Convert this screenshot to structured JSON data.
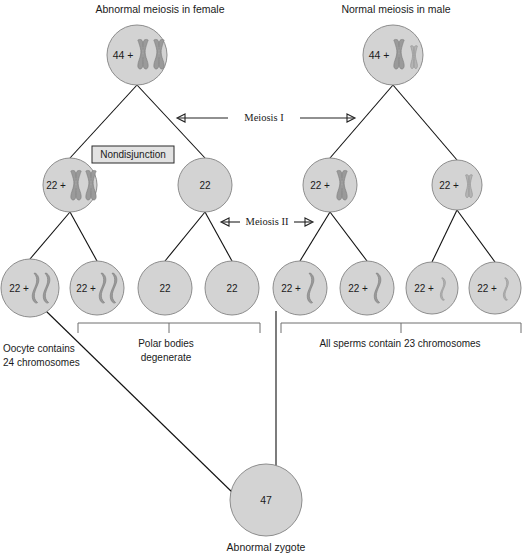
{
  "figure": {
    "title_left": "Abnormal meiosis in female",
    "title_right": "Normal meiosis in male",
    "stage_one": "Meiosis I",
    "stage_two": "Meiosis II",
    "nondisjunction": "Nondisjunction",
    "note_oocyte": "Oocyte contains",
    "note_oocyte_2": "24 chromosomes",
    "note_polar": "Polar bodies",
    "note_polar_2": "degenerate",
    "note_sperms": "All sperms contain 23 chromosomes",
    "zygote_caption": "Abnormal zygote"
  },
  "colors": {
    "cell_fill": "#d3d3d3",
    "cell_stroke": "#8d8d8d",
    "chromosome": "#9a9a9a",
    "chromosome_light": "#b4b4b4",
    "line": "#111111",
    "bracket": "#6f6f6f",
    "text": "#1a1a1a",
    "box_fill": "#e2e2e2"
  },
  "generation1": [
    {
      "id": "oogonium",
      "label": "44 +",
      "x": 137,
      "y": 55,
      "r": 30,
      "chromosomes": [
        "X-dup",
        "X-dup"
      ]
    },
    {
      "id": "spermatogonium",
      "label": "44 +",
      "x": 393,
      "y": 55,
      "r": 30,
      "chromosomes": [
        "X-dup",
        "Y-dup"
      ]
    }
  ],
  "generation2": [
    {
      "id": "secondary-oocyte",
      "label": "22 +",
      "x": 70,
      "y": 185,
      "r": 27,
      "chromosomes": [
        "X-dup",
        "X-dup"
      ]
    },
    {
      "id": "first-polar-body",
      "label": "22",
      "x": 205,
      "y": 185,
      "r": 27,
      "chromosomes": []
    },
    {
      "id": "secondary-spermatocyte-x",
      "label": "22 +",
      "x": 330,
      "y": 185,
      "r": 27,
      "chromosomes": [
        "X-dup"
      ]
    },
    {
      "id": "secondary-spermatocyte-y",
      "label": "22 +",
      "x": 457,
      "y": 185,
      "r": 25,
      "chromosomes": [
        "Y-dup"
      ]
    }
  ],
  "generation3": [
    {
      "id": "oocyte",
      "label": "22 +",
      "x": 30,
      "y": 288,
      "r": 29,
      "chromosomes": [
        "X-single",
        "X-single"
      ]
    },
    {
      "id": "polar-body-1",
      "label": "22 +",
      "x": 97,
      "y": 288,
      "r": 27,
      "chromosomes": [
        "X-single",
        "X-single"
      ]
    },
    {
      "id": "polar-body-2",
      "label": "22",
      "x": 165,
      "y": 288,
      "r": 27,
      "chromosomes": []
    },
    {
      "id": "polar-body-3",
      "label": "22",
      "x": 232,
      "y": 288,
      "r": 27,
      "chromosomes": []
    },
    {
      "id": "sperm-x-1",
      "label": "22 +",
      "x": 300,
      "y": 288,
      "r": 27,
      "chromosomes": [
        "X-single"
      ]
    },
    {
      "id": "sperm-x-2",
      "label": "22 +",
      "x": 367,
      "y": 288,
      "r": 27,
      "chromosomes": [
        "X-single"
      ]
    },
    {
      "id": "sperm-y-1",
      "label": "22 +",
      "x": 432,
      "y": 288,
      "r": 26,
      "chromosomes": [
        "Y-single"
      ]
    },
    {
      "id": "sperm-y-2",
      "label": "22 +",
      "x": 495,
      "y": 288,
      "r": 26,
      "chromosomes": [
        "Y-single"
      ]
    }
  ],
  "zygote": {
    "id": "abnormal-zygote",
    "label": "47",
    "x": 266,
    "y": 500,
    "r": 36
  }
}
